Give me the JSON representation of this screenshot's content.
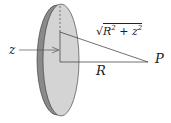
{
  "diagram": {
    "labels": {
      "z": "z",
      "R": "R",
      "P": "P",
      "distance": {
        "radical": "√",
        "R": "R",
        "R_exp": "2",
        "plus": " + ",
        "z": "z",
        "z_exp": "2"
      }
    },
    "colors": {
      "disk_face": "#d4d4d4",
      "disk_rim": "#8a8a8a",
      "stroke": "#333333",
      "background": "#ffffff"
    }
  }
}
